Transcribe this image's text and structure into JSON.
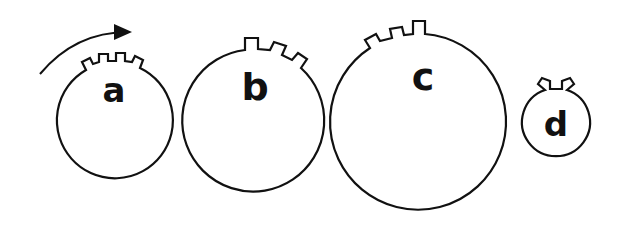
{
  "diagram": {
    "rotation_arrow": {
      "direction": "clockwise"
    },
    "wheels": [
      {
        "label": "a",
        "cx": 114,
        "cy": 121,
        "r": 58,
        "notches": 3
      },
      {
        "label": "b",
        "cx": 252,
        "cy": 121,
        "r": 71,
        "notches": 3
      },
      {
        "label": "c",
        "cx": 420,
        "cy": 124,
        "r": 88,
        "notches": 3
      },
      {
        "label": "d",
        "cx": 556,
        "cy": 123,
        "r": 34,
        "notches": 1
      }
    ]
  }
}
